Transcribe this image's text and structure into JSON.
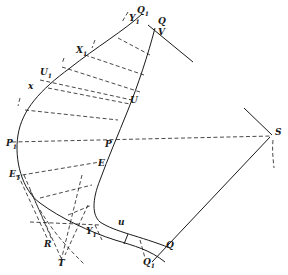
{
  "figure": {
    "type": "geometric construction diagram",
    "stroke_color": "#1a1a1a",
    "background": "#ffffff"
  },
  "labels": {
    "Q1_top": "Q",
    "Q1_top_sub": "1",
    "Q_top": "Q",
    "Y1_top": "Y",
    "Y1_top_sub": "1",
    "V": "V",
    "X1": "X",
    "X1_sub": "1",
    "U1": "U",
    "U1_sub": "1",
    "x": "x",
    "U": "U",
    "P1": "P",
    "P1_sub": "1",
    "P": "P",
    "S": "S",
    "E1": "E",
    "E1_sub": "1",
    "E": "E",
    "u": "u",
    "Y1_bottom": "Y",
    "Y1_bottom_sub": "1",
    "R": "R",
    "T": "T",
    "Q_bottom": "Q",
    "Q1_bottom": "Q",
    "Q1_bottom_sub": "1"
  }
}
